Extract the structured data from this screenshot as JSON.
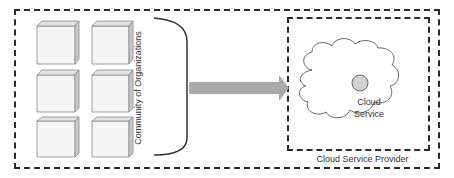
{
  "diagram": {
    "community_label": "Community of Organizations",
    "cloud_service_label_line1": "Cloud",
    "cloud_service_label_line2": "Service",
    "provider_label": "Cloud Service Provider",
    "organization_count": 6,
    "colors": {
      "border": "#2b2b2b",
      "cube_face": "#f4f4f4",
      "cube_side": "#c8c8c8",
      "cube_top": "#e2e2e2",
      "arrow": "#a9a9a9",
      "service_node": "#cfcfcf"
    }
  }
}
